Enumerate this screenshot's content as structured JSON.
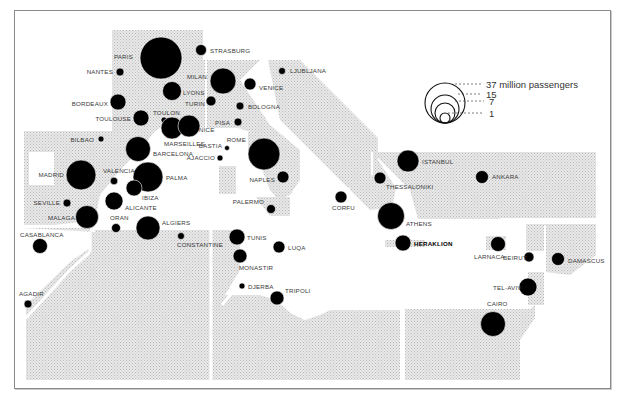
{
  "chart_data": {
    "type": "proportional-symbol-map",
    "title": "",
    "legend": {
      "title": "million passengers",
      "entries": [
        {
          "label": "37 million passengers",
          "value": 37
        },
        {
          "label": "15",
          "value": 15
        },
        {
          "label": "7",
          "value": 7
        },
        {
          "label": "1",
          "value": 1
        }
      ]
    },
    "cities": [
      {
        "name": "PARIS",
        "x": 161,
        "y": 58,
        "r": 21,
        "lx": 133,
        "ly": 59,
        "anchor": "end"
      },
      {
        "name": "STRASBURG",
        "x": 201,
        "y": 50,
        "r": 5.5,
        "lx": 210,
        "ly": 53,
        "anchor": "start"
      },
      {
        "name": "NANTES",
        "x": 120,
        "y": 72,
        "r": 4,
        "lx": 113,
        "ly": 74,
        "anchor": "end"
      },
      {
        "name": "MILAN",
        "x": 223,
        "y": 81,
        "r": 13,
        "lx": 207,
        "ly": 79,
        "anchor": "end"
      },
      {
        "name": "VENICE",
        "x": 250,
        "y": 84,
        "r": 6,
        "lx": 259,
        "ly": 90,
        "anchor": "start"
      },
      {
        "name": "LJUBLJANA",
        "x": 282,
        "y": 71,
        "r": 3.5,
        "lx": 290,
        "ly": 73,
        "anchor": "start"
      },
      {
        "name": "LYONS",
        "x": 172,
        "y": 91,
        "r": 9.5,
        "lx": 183,
        "ly": 95,
        "anchor": "start"
      },
      {
        "name": "TURIN",
        "x": 211,
        "y": 101,
        "r": 5,
        "lx": 205,
        "ly": 106,
        "anchor": "end"
      },
      {
        "name": "BOLOGNA",
        "x": 240,
        "y": 106,
        "r": 4,
        "lx": 248,
        "ly": 109,
        "anchor": "start"
      },
      {
        "name": "BORDEAUX",
        "x": 118,
        "y": 102,
        "r": 8,
        "lx": 108,
        "ly": 106,
        "anchor": "end"
      },
      {
        "name": "TOULOUSE",
        "x": 141,
        "y": 118,
        "r": 8,
        "lx": 131,
        "ly": 121,
        "anchor": "end"
      },
      {
        "name": "TOULON",
        "x": 164,
        "y": 120,
        "r": 3,
        "lx": 153,
        "ly": 115,
        "anchor": "start"
      },
      {
        "name": "PISA",
        "x": 238,
        "y": 122,
        "r": 4,
        "lx": 230,
        "ly": 125,
        "anchor": "end"
      },
      {
        "name": "MARSEILLES",
        "x": 172,
        "y": 128,
        "r": 11,
        "lx": 164,
        "ly": 146,
        "anchor": "start"
      },
      {
        "name": "NICE",
        "x": 189,
        "y": 126,
        "r": 11,
        "lx": 199,
        "ly": 132,
        "anchor": "start"
      },
      {
        "name": "BILBAO",
        "x": 101,
        "y": 139,
        "r": 3,
        "lx": 94,
        "ly": 142,
        "anchor": "end"
      },
      {
        "name": "ROME",
        "x": 264,
        "y": 154,
        "r": 16,
        "lx": 246,
        "ly": 142,
        "anchor": "end"
      },
      {
        "name": "BASTIA",
        "x": 227,
        "y": 148,
        "r": 2.5,
        "lx": 222,
        "ly": 148,
        "anchor": "end"
      },
      {
        "name": "AJACCIO",
        "x": 220,
        "y": 158,
        "r": 3,
        "lx": 215,
        "ly": 160,
        "anchor": "end"
      },
      {
        "name": "BARCELONA",
        "x": 138,
        "y": 149,
        "r": 12.5,
        "lx": 153,
        "ly": 156,
        "anchor": "start"
      },
      {
        "name": "MADRID",
        "x": 81,
        "y": 175,
        "r": 15,
        "lx": 64,
        "ly": 177,
        "anchor": "end"
      },
      {
        "name": "VALENCIA",
        "x": 114,
        "y": 181,
        "r": 3.8,
        "lx": 103,
        "ly": 173,
        "anchor": "start"
      },
      {
        "name": "PALMA",
        "x": 148,
        "y": 177,
        "r": 15,
        "lx": 166,
        "ly": 180,
        "anchor": "start"
      },
      {
        "name": "NAPLES",
        "x": 283,
        "y": 177,
        "r": 6,
        "lx": 275,
        "ly": 182,
        "anchor": "end"
      },
      {
        "name": "IBIZA",
        "x": 134,
        "y": 188,
        "r": 8,
        "lx": 142,
        "ly": 200,
        "anchor": "start"
      },
      {
        "name": "SEVILLE",
        "x": 67,
        "y": 203,
        "r": 4,
        "lx": 60,
        "ly": 205,
        "anchor": "end"
      },
      {
        "name": "ALICANTE",
        "x": 114,
        "y": 201,
        "r": 9,
        "lx": 125,
        "ly": 210,
        "anchor": "start"
      },
      {
        "name": "PALERMO",
        "x": 271,
        "y": 209,
        "r": 4.5,
        "lx": 264,
        "ly": 204,
        "anchor": "end"
      },
      {
        "name": "MALAGA",
        "x": 87,
        "y": 217,
        "r": 11.5,
        "lx": 75,
        "ly": 220,
        "anchor": "end"
      },
      {
        "name": "ORAN",
        "x": 116,
        "y": 228,
        "r": 4.5,
        "lx": 110,
        "ly": 220,
        "anchor": "start"
      },
      {
        "name": "ALGIERS",
        "x": 148,
        "y": 228,
        "r": 12,
        "lx": 162,
        "ly": 225,
        "anchor": "start"
      },
      {
        "name": "CASABLANCA",
        "x": 40,
        "y": 246,
        "r": 7.5,
        "lx": 20,
        "ly": 237,
        "anchor": "start"
      },
      {
        "name": "CONSTANTINE",
        "x": 181,
        "y": 236,
        "r": 3.5,
        "lx": 177,
        "ly": 247,
        "anchor": "start"
      },
      {
        "name": "TUNIS",
        "x": 237,
        "y": 237,
        "r": 8,
        "lx": 247,
        "ly": 240,
        "anchor": "start"
      },
      {
        "name": "LUQA",
        "x": 279,
        "y": 247,
        "r": 6,
        "lx": 288,
        "ly": 250,
        "anchor": "start"
      },
      {
        "name": "MONASTIR",
        "x": 240,
        "y": 256,
        "r": 7,
        "lx": 239,
        "ly": 270,
        "anchor": "start"
      },
      {
        "name": "DJERBA",
        "x": 242,
        "y": 286,
        "r": 3,
        "lx": 248,
        "ly": 289,
        "anchor": "start"
      },
      {
        "name": "TRIPOLI",
        "x": 277,
        "y": 298,
        "r": 7,
        "lx": 285,
        "ly": 293,
        "anchor": "start"
      },
      {
        "name": "AGADIR",
        "x": 28,
        "y": 304,
        "r": 4,
        "lx": 19,
        "ly": 296,
        "anchor": "start"
      },
      {
        "name": "CORFU",
        "x": 341,
        "y": 197,
        "r": 6,
        "lx": 332,
        "ly": 210,
        "anchor": "start"
      },
      {
        "name": "ISTANBUL",
        "x": 408,
        "y": 161,
        "r": 11,
        "lx": 422,
        "ly": 164,
        "anchor": "start"
      },
      {
        "name": "THESSALONIKI",
        "x": 380,
        "y": 178,
        "r": 6,
        "lx": 386,
        "ly": 189,
        "anchor": "start"
      },
      {
        "name": "ANKARA",
        "x": 482,
        "y": 177,
        "r": 6.5,
        "lx": 492,
        "ly": 179,
        "anchor": "start"
      },
      {
        "name": "ATHENS",
        "x": 391,
        "y": 216,
        "r": 13.5,
        "lx": 406,
        "ly": 226,
        "anchor": "start"
      },
      {
        "name": "HERAKLION",
        "x": 403,
        "y": 243,
        "r": 8,
        "lx": 414,
        "ly": 246,
        "anchor": "start",
        "bold": true
      },
      {
        "name": "LARNACA",
        "x": 498,
        "y": 244,
        "r": 7.5,
        "lx": 474,
        "ly": 259,
        "anchor": "start"
      },
      {
        "name": "BEIRUT",
        "x": 529,
        "y": 257,
        "r": 5,
        "lx": 503,
        "ly": 260,
        "anchor": "start"
      },
      {
        "name": "DAMASCUS",
        "x": 558,
        "y": 259,
        "r": 6.5,
        "lx": 568,
        "ly": 263,
        "anchor": "start"
      },
      {
        "name": "TEL-AVIV",
        "x": 528,
        "y": 287,
        "r": 9,
        "lx": 493,
        "ly": 290,
        "anchor": "start"
      },
      {
        "name": "CAIRO",
        "x": 493,
        "y": 324,
        "r": 12.5,
        "lx": 487,
        "ly": 306,
        "anchor": "start"
      }
    ]
  },
  "legend": {
    "line1": "37 million passengers",
    "line2": "15",
    "line3": "7",
    "line4": "1"
  }
}
